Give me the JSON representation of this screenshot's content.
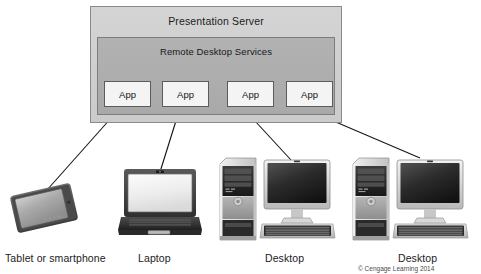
{
  "diagram": {
    "server": {
      "title": "Presentation Server",
      "inner_title": "Remote Desktop Services",
      "apps": [
        {
          "label": "App"
        },
        {
          "label": "App"
        },
        {
          "label": "App"
        },
        {
          "label": "App"
        }
      ]
    },
    "devices": [
      {
        "id": "tablet",
        "label": "Tablet or smartphone",
        "icon": "tablet-icon"
      },
      {
        "id": "laptop",
        "label": "Laptop",
        "icon": "laptop-icon"
      },
      {
        "id": "desktop1",
        "label": "Desktop",
        "icon": "desktop-icon"
      },
      {
        "id": "desktop2",
        "label": "Desktop",
        "icon": "desktop-icon"
      }
    ],
    "copyright": "© Cengage Learning 2014",
    "colors": {
      "background": "#ffffff",
      "server_outer_fill": "#d0d0d0",
      "server_inner_fill": "#adadad",
      "app_fill": "#f4f4f4",
      "outline": "#7d7d7d",
      "line": "#1a1a1a",
      "text": "#1b1b1b"
    }
  }
}
